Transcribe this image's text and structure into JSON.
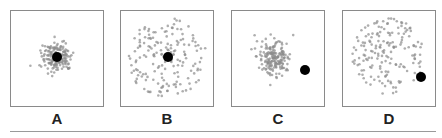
{
  "diagram": {
    "panels": [
      {
        "id": "A",
        "label": "A",
        "left": 10,
        "spread": "tight",
        "scatter_radius": 17,
        "scatter_center": [
          46,
          46
        ],
        "target_center": [
          46,
          46
        ],
        "count": 180,
        "description": "accurate and precise"
      },
      {
        "id": "B",
        "label": "B",
        "left": 120,
        "spread": "wide",
        "scatter_radius": 40,
        "scatter_center": [
          46,
          47
        ],
        "target_center": [
          47,
          46
        ],
        "count": 170,
        "description": "accurate but imprecise"
      },
      {
        "id": "C",
        "label": "C",
        "left": 231,
        "spread": "tight",
        "scatter_radius": 19,
        "scatter_center": [
          42,
          46
        ],
        "target_center": [
          73,
          59
        ],
        "count": 180,
        "description": "precise but inaccurate"
      },
      {
        "id": "D",
        "label": "D",
        "left": 342,
        "spread": "wide",
        "scatter_radius": 38,
        "scatter_center": [
          44,
          45
        ],
        "target_center": [
          78,
          66
        ],
        "count": 170,
        "description": "imprecise and inaccurate"
      }
    ],
    "colors": {
      "dots": "#8c8c8c",
      "target": "#000000",
      "border": "#8a8a8a"
    }
  }
}
